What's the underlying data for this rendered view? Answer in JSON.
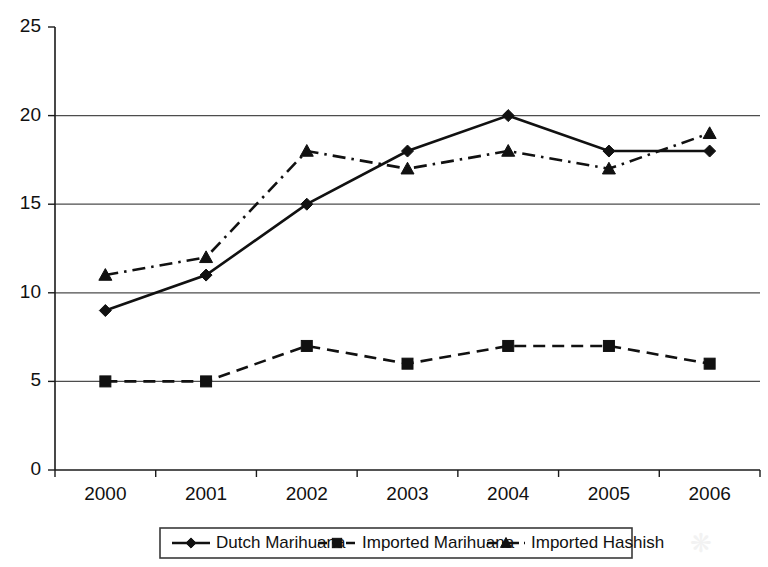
{
  "chart_data": {
    "type": "line",
    "title": "",
    "subtitle": "",
    "xlabel": "",
    "ylabel": "",
    "categories": [
      "2000",
      "2001",
      "2002",
      "2003",
      "2004",
      "2005",
      "2006"
    ],
    "x": [
      2000,
      2001,
      2002,
      2003,
      2004,
      2005,
      2006
    ],
    "ylim": [
      0,
      25
    ],
    "yticks": [
      0,
      5,
      10,
      15,
      20,
      25
    ],
    "ytick_labels": [
      "0",
      "5",
      "10",
      "15",
      "20",
      "25"
    ],
    "grid": "horizontal",
    "legend_position": "bottom-center",
    "series": [
      {
        "name": "Dutch Marihuana",
        "values": [
          9,
          11,
          15,
          18,
          20,
          18,
          18
        ],
        "marker": "diamond",
        "line_style": "solid",
        "color": "#111111"
      },
      {
        "name": "Imported Marihuana",
        "values": [
          5,
          5,
          7,
          6,
          7,
          7,
          6
        ],
        "marker": "square",
        "line_style": "dashed",
        "color": "#111111"
      },
      {
        "name": "Imported Hashish",
        "values": [
          11,
          12,
          18,
          17,
          18,
          17,
          19
        ],
        "marker": "triangle",
        "line_style": "dashdot",
        "color": "#111111"
      }
    ]
  },
  "axes": {
    "y_tick_labels": [
      "25",
      "20",
      "15",
      "10",
      "5",
      "0"
    ],
    "x_tick_labels": [
      "2000",
      "2001",
      "2002",
      "2003",
      "2004",
      "2005",
      "2006"
    ]
  },
  "legend": {
    "items": [
      {
        "label": "Dutch Marihuana",
        "marker": "diamond",
        "line_style": "solid"
      },
      {
        "label": "Imported Marihuana",
        "marker": "square",
        "line_style": "dashed"
      },
      {
        "label": "Imported Hashish",
        "marker": "triangle",
        "line_style": "dashdot"
      }
    ]
  },
  "colors": {
    "ink": "#111111",
    "grid": "#4d4d4d",
    "background": "#ffffff"
  }
}
